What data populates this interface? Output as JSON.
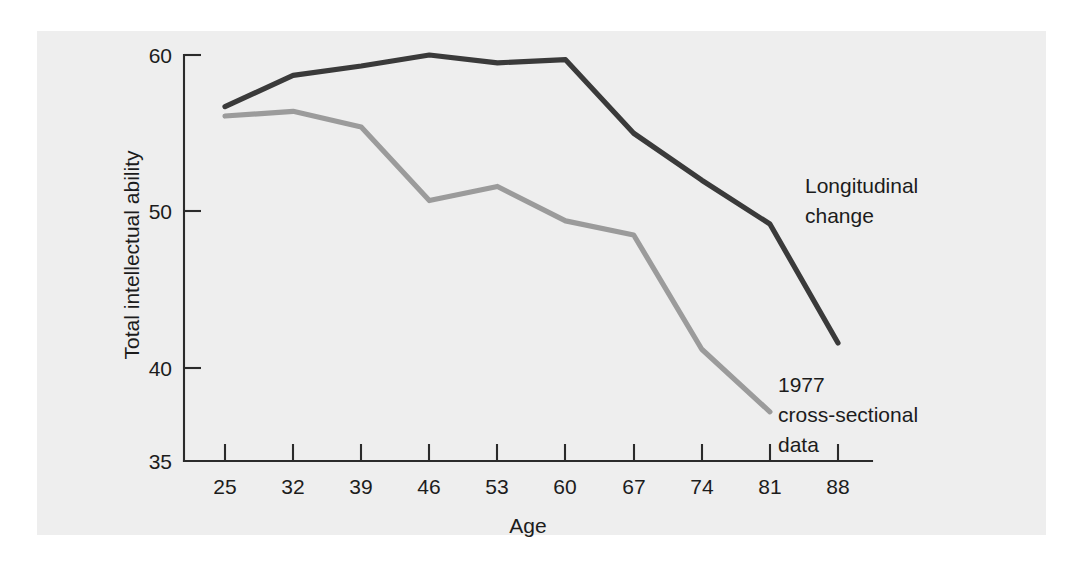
{
  "chart_data": {
    "type": "line",
    "title": "",
    "xlabel": "Age",
    "ylabel": "Total intellectual ability",
    "x": [
      25,
      32,
      39,
      46,
      53,
      60,
      67,
      74,
      81,
      88
    ],
    "xticklabels": [
      "25",
      "32",
      "39",
      "46",
      "53",
      "60",
      "67",
      "74",
      "81",
      "88"
    ],
    "yticks": [
      35,
      40,
      50,
      60
    ],
    "yticklabels": [
      "35",
      "40",
      "50",
      "60"
    ],
    "xlim": [
      25,
      88
    ],
    "ylim": [
      35,
      60
    ],
    "grid": false,
    "legend_position": "inline-annotations",
    "series": [
      {
        "name": "Longitudinal change",
        "color": "#3a3a3a",
        "x": [
          25,
          32,
          39,
          46,
          53,
          60,
          67,
          74,
          81,
          88
        ],
        "values": [
          56.7,
          58.7,
          59.3,
          60.0,
          59.5,
          59.7,
          55.0,
          52.0,
          49.2,
          41.6
        ]
      },
      {
        "name": "1977 cross-sectional data",
        "color": "#9b9b9b",
        "x": [
          25,
          32,
          39,
          46,
          53,
          60,
          67,
          74,
          81
        ],
        "values": [
          56.1,
          56.4,
          55.4,
          50.7,
          51.6,
          49.4,
          48.5,
          41.2,
          37.2
        ]
      }
    ],
    "annotations": [
      {
        "name": "longitudinal-change",
        "lines": [
          "Longitudinal",
          "change"
        ],
        "x": 805,
        "y": 186
      },
      {
        "name": "cross-sectional-data",
        "lines": [
          "1977",
          "cross-sectional",
          "data"
        ],
        "x": 778,
        "y": 386
      }
    ]
  },
  "axes": {
    "ylabel": "Total intellectual ability",
    "xlabel": "Age",
    "ytick_labels": [
      "60",
      "50",
      "40",
      "35"
    ],
    "xtick_labels": [
      "25",
      "32",
      "39",
      "46",
      "53",
      "60",
      "67",
      "74",
      "81",
      "88"
    ]
  },
  "annotations": {
    "longitudinal": {
      "line1": "Longitudinal",
      "line2": "change"
    },
    "cross_sectional": {
      "line1": "1977",
      "line2": "cross-sectional",
      "line3": "data"
    }
  },
  "colors": {
    "longitudinal_line": "#3a3a3a",
    "cross_sectional_line": "#9b9b9b",
    "axis": "#2b2b2b",
    "panel_background": "#eeeeee",
    "page_background": "#ffffff"
  }
}
